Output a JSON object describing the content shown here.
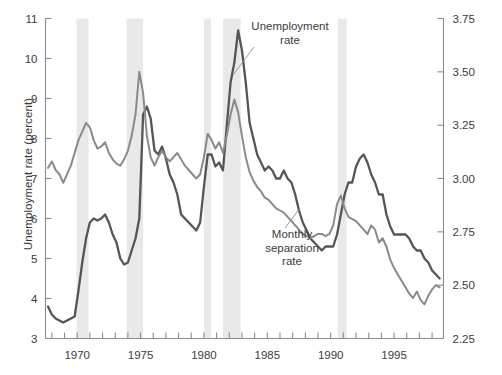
{
  "chart_data": {
    "type": "line",
    "title": "",
    "xlabel": "",
    "ylabel": "Unemployment rate (percent)",
    "ylabel_right": "Monthly separation rate (percent)",
    "xlim": [
      1967.5,
      1998.9
    ],
    "ylim_left": [
      3,
      11
    ],
    "ylim_right": [
      2.25,
      3.75
    ],
    "left_ticks": [
      "3",
      "4",
      "5",
      "6",
      "7",
      "8",
      "9",
      "10",
      "11"
    ],
    "left_tick_values": [
      3,
      4,
      5,
      6,
      7,
      8,
      9,
      10,
      11
    ],
    "right_ticks": [
      "2.25",
      "2.50",
      "2.75",
      "3.00",
      "3.25",
      "3.50",
      "3.75"
    ],
    "right_tick_values": [
      2.25,
      2.5,
      2.75,
      3.0,
      3.25,
      3.5,
      3.75
    ],
    "x_tick_labels": [
      "1970",
      "1975",
      "1980",
      "1985",
      "1990",
      "1995"
    ],
    "x_tick_label_values": [
      1970,
      1975,
      1980,
      1985,
      1990,
      1995
    ],
    "x_minor_tick_step": 1,
    "grid": false,
    "legend_position": "inline-annotation",
    "annotations": [
      {
        "name": "unemployment-label",
        "text": "Unemployment\nrate",
        "x": 1982.6,
        "y": 10.75
      },
      {
        "name": "separation-label",
        "text": "Monthly\nseparation\nrate",
        "x": 1983.4,
        "y": 5.75
      }
    ],
    "recession_bands": [
      {
        "start": 1969.95,
        "end": 1970.9
      },
      {
        "start": 1973.9,
        "end": 1975.2
      },
      {
        "start": 1980.0,
        "end": 1980.55
      },
      {
        "start": 1981.5,
        "end": 1982.9
      },
      {
        "start": 1990.55,
        "end": 1991.25
      }
    ],
    "recession_band_color": "#e9e9e9",
    "series": [
      {
        "name": "Unemployment rate",
        "axis": "left",
        "color": "#555555",
        "x": [
          1967.7,
          1968.0,
          1968.3,
          1968.6,
          1968.9,
          1969.2,
          1969.5,
          1969.8,
          1970.1,
          1970.4,
          1970.7,
          1971.0,
          1971.3,
          1971.6,
          1971.9,
          1972.2,
          1972.5,
          1972.8,
          1973.1,
          1973.4,
          1973.7,
          1974.0,
          1974.3,
          1974.6,
          1974.9,
          1975.2,
          1975.5,
          1975.8,
          1976.1,
          1976.4,
          1976.7,
          1977.0,
          1977.3,
          1977.6,
          1977.9,
          1978.2,
          1978.5,
          1978.8,
          1979.1,
          1979.4,
          1979.7,
          1980.0,
          1980.3,
          1980.6,
          1980.9,
          1981.2,
          1981.5,
          1981.8,
          1982.1,
          1982.4,
          1982.7,
          1983.0,
          1983.3,
          1983.6,
          1983.9,
          1984.2,
          1984.5,
          1984.8,
          1985.1,
          1985.4,
          1985.7,
          1986.0,
          1986.3,
          1986.6,
          1986.9,
          1987.2,
          1987.5,
          1987.8,
          1988.1,
          1988.4,
          1988.7,
          1989.0,
          1989.3,
          1989.6,
          1989.9,
          1990.2,
          1990.5,
          1990.8,
          1991.1,
          1991.4,
          1991.7,
          1992.0,
          1992.3,
          1992.6,
          1992.9,
          1993.2,
          1993.5,
          1993.8,
          1994.1,
          1994.4,
          1994.7,
          1995.0,
          1995.3,
          1995.6,
          1995.9,
          1996.2,
          1996.5,
          1996.8,
          1997.1,
          1997.4,
          1997.7,
          1998.0,
          1998.3,
          1998.6
        ],
        "y": [
          3.8,
          3.6,
          3.5,
          3.45,
          3.4,
          3.45,
          3.5,
          3.55,
          4.2,
          4.9,
          5.5,
          5.9,
          6.0,
          5.95,
          6.0,
          6.1,
          5.9,
          5.6,
          5.4,
          5.0,
          4.85,
          4.9,
          5.2,
          5.5,
          6.0,
          8.6,
          8.8,
          8.5,
          7.7,
          7.6,
          7.8,
          7.5,
          7.1,
          6.9,
          6.6,
          6.1,
          6.0,
          5.9,
          5.8,
          5.7,
          5.9,
          6.8,
          7.6,
          7.6,
          7.3,
          7.4,
          7.2,
          8.3,
          9.4,
          9.9,
          10.7,
          10.2,
          9.4,
          8.4,
          8.0,
          7.6,
          7.4,
          7.2,
          7.3,
          7.2,
          7.0,
          7.0,
          7.2,
          7.0,
          6.9,
          6.6,
          6.2,
          5.9,
          5.7,
          5.5,
          5.4,
          5.3,
          5.2,
          5.3,
          5.3,
          5.3,
          5.6,
          6.1,
          6.6,
          6.9,
          6.9,
          7.3,
          7.5,
          7.6,
          7.4,
          7.1,
          6.9,
          6.6,
          6.6,
          6.1,
          5.8,
          5.6,
          5.6,
          5.6,
          5.6,
          5.5,
          5.3,
          5.2,
          5.2,
          5.0,
          4.9,
          4.7,
          4.6,
          4.5
        ]
      },
      {
        "name": "Monthly separation rate",
        "axis": "right",
        "color": "#8a8a8a",
        "x": [
          1967.7,
          1968.0,
          1968.3,
          1968.6,
          1968.9,
          1969.2,
          1969.5,
          1969.8,
          1970.1,
          1970.4,
          1970.7,
          1971.0,
          1971.3,
          1971.6,
          1971.9,
          1972.2,
          1972.5,
          1972.8,
          1973.1,
          1973.4,
          1973.7,
          1974.0,
          1974.3,
          1974.6,
          1974.9,
          1975.2,
          1975.5,
          1975.8,
          1976.1,
          1976.4,
          1976.7,
          1977.0,
          1977.3,
          1977.6,
          1977.9,
          1978.2,
          1978.5,
          1978.8,
          1979.1,
          1979.4,
          1979.7,
          1980.0,
          1980.3,
          1980.6,
          1980.9,
          1981.2,
          1981.5,
          1981.8,
          1982.1,
          1982.4,
          1982.7,
          1983.0,
          1983.3,
          1983.6,
          1983.9,
          1984.2,
          1984.5,
          1984.8,
          1985.1,
          1985.4,
          1985.7,
          1986.0,
          1986.3,
          1986.6,
          1986.9,
          1987.2,
          1987.5,
          1987.8,
          1988.1,
          1988.4,
          1988.7,
          1989.0,
          1989.3,
          1989.6,
          1989.9,
          1990.2,
          1990.5,
          1990.8,
          1991.1,
          1991.4,
          1991.7,
          1992.0,
          1992.3,
          1992.6,
          1992.9,
          1993.2,
          1993.5,
          1993.8,
          1994.1,
          1994.4,
          1994.7,
          1995.0,
          1995.3,
          1995.6,
          1995.9,
          1996.2,
          1996.5,
          1996.8,
          1997.1,
          1997.4,
          1997.7,
          1998.0,
          1998.3,
          1998.6
        ],
        "y": [
          3.05,
          3.08,
          3.04,
          3.02,
          2.98,
          3.02,
          3.06,
          3.12,
          3.18,
          3.22,
          3.26,
          3.24,
          3.18,
          3.14,
          3.15,
          3.17,
          3.12,
          3.09,
          3.07,
          3.06,
          3.09,
          3.13,
          3.2,
          3.3,
          3.5,
          3.4,
          3.2,
          3.1,
          3.06,
          3.1,
          3.13,
          3.1,
          3.08,
          3.1,
          3.12,
          3.09,
          3.06,
          3.04,
          3.02,
          3.0,
          3.02,
          3.1,
          3.21,
          3.18,
          3.14,
          3.17,
          3.12,
          3.2,
          3.3,
          3.37,
          3.31,
          3.2,
          3.1,
          3.03,
          2.99,
          2.96,
          2.94,
          2.91,
          2.9,
          2.88,
          2.86,
          2.85,
          2.84,
          2.82,
          2.8,
          2.78,
          2.76,
          2.74,
          2.73,
          2.72,
          2.73,
          2.74,
          2.74,
          2.73,
          2.74,
          2.78,
          2.88,
          2.92,
          2.86,
          2.82,
          2.81,
          2.8,
          2.78,
          2.76,
          2.74,
          2.78,
          2.76,
          2.7,
          2.72,
          2.68,
          2.62,
          2.58,
          2.55,
          2.52,
          2.49,
          2.46,
          2.44,
          2.47,
          2.43,
          2.41,
          2.45,
          2.48,
          2.5,
          2.49
        ]
      }
    ]
  },
  "axes": {
    "left_title": "Unemployment rate (percent)",
    "right_title": "Monthly separation rate (percent)"
  },
  "labels": {
    "unemployment_line1": "Unemployment",
    "unemployment_line2": "rate",
    "separation_line1": "Monthly",
    "separation_line2": "separation",
    "separation_line3": "rate"
  },
  "colors": {
    "unemployment_line": "#555555",
    "separation_line": "#8a8a8a",
    "recession_band": "#e9e9e9",
    "axis": "#8c8c8c",
    "text": "#3b3b3b"
  }
}
